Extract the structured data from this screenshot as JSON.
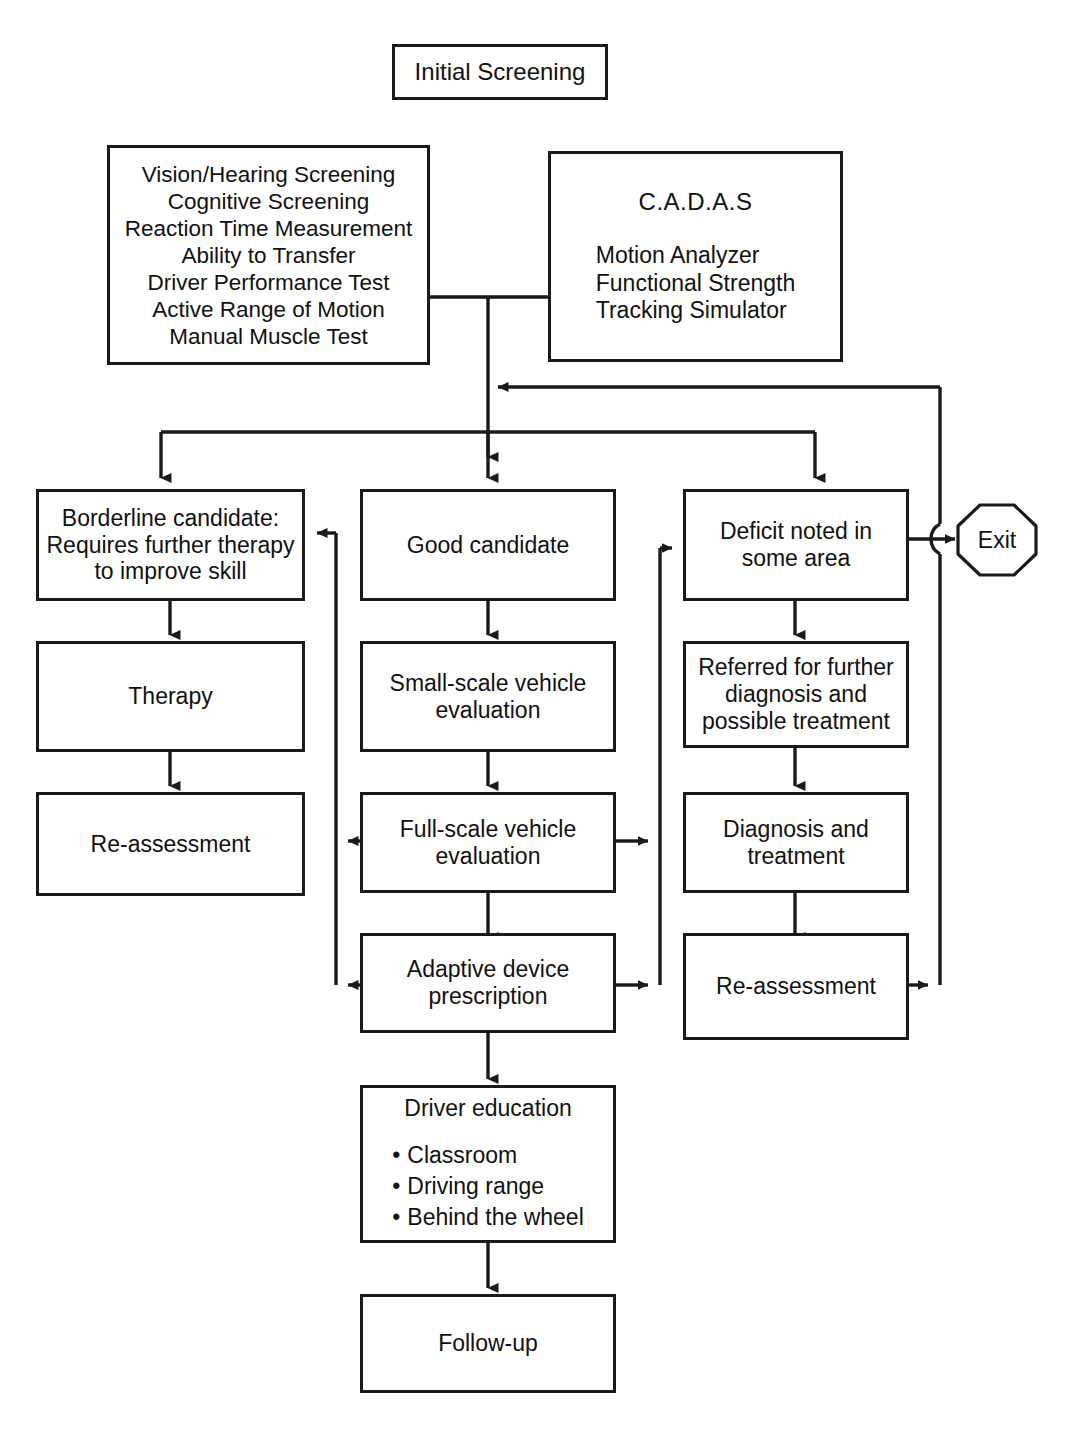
{
  "diagram": {
    "stroke_color": "#1a1a1a",
    "background_color": "#ffffff"
  },
  "nodes": {
    "initial_screening": {
      "label": "Initial Screening"
    },
    "screening_tests": {
      "items": [
        "Vision/Hearing Screening",
        "Cognitive Screening",
        "Reaction Time Measurement",
        "Ability to Transfer",
        "Driver Performance Test",
        "Active Range of Motion",
        "Manual Muscle Test"
      ]
    },
    "cadas": {
      "heading": "C.A.D.A.S",
      "items": [
        "Motion Analyzer",
        "Functional Strength",
        "Tracking Simulator"
      ]
    },
    "borderline": {
      "lines": [
        "Borderline candidate:",
        "Requires further therapy",
        "to improve skill"
      ]
    },
    "therapy": {
      "label": "Therapy"
    },
    "reassessment_left": {
      "label": "Re-assessment"
    },
    "good_candidate": {
      "label": "Good candidate"
    },
    "small_scale": {
      "lines": [
        "Small-scale vehicle",
        "evaluation"
      ]
    },
    "full_scale": {
      "lines": [
        "Full-scale vehicle",
        "evaluation"
      ]
    },
    "adaptive_device": {
      "lines": [
        "Adaptive device",
        "prescription"
      ]
    },
    "driver_education": {
      "heading": "Driver education",
      "bullet": "•",
      "items": [
        "Classroom",
        "Driving range",
        "Behind the wheel"
      ]
    },
    "follow_up": {
      "label": "Follow-up"
    },
    "deficit": {
      "lines": [
        "Deficit noted in",
        "some area"
      ]
    },
    "referred": {
      "lines": [
        "Referred for further",
        "diagnosis and",
        "possible treatment"
      ]
    },
    "diagnosis_treatment": {
      "lines": [
        "Diagnosis and",
        "treatment"
      ]
    },
    "reassessment_right": {
      "label": "Re-assessment"
    },
    "exit": {
      "label": "Exit"
    }
  }
}
